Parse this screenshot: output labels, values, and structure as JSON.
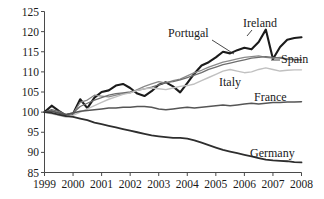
{
  "chart_data": {
    "type": "line",
    "title": "",
    "xlabel": "",
    "ylabel": "",
    "xlim": [
      1999,
      2008
    ],
    "ylim": [
      85,
      125
    ],
    "grid": false,
    "legend_position": "inline-annotations",
    "xticks": [
      "1999",
      "2000",
      "2001",
      "2002",
      "2003",
      "2004",
      "2005",
      "2006",
      "2007",
      "2008"
    ],
    "yticks": [
      "85",
      "90",
      "95",
      "100",
      "105",
      "110",
      "115",
      "120",
      "125"
    ],
    "x": [
      1999.0,
      1999.25,
      1999.5,
      1999.75,
      2000.0,
      2000.25,
      2000.5,
      2000.75,
      2001.0,
      2001.25,
      2001.5,
      2001.75,
      2002.0,
      2002.25,
      2002.5,
      2002.75,
      2003.0,
      2003.25,
      2003.5,
      2003.75,
      2004.0,
      2004.25,
      2004.5,
      2004.75,
      2005.0,
      2005.25,
      2005.5,
      2005.75,
      2006.0,
      2006.25,
      2006.5,
      2006.75,
      2007.0,
      2007.25,
      2007.5,
      2007.75,
      2008.0
    ],
    "series": [
      {
        "name": "Ireland",
        "color": "#1b1b1b",
        "width": 2.1,
        "label": "Ireland",
        "values": [
          100.0,
          101.6,
          100.3,
          99.2,
          99.6,
          103.2,
          101.0,
          103.6,
          105.0,
          105.4,
          106.6,
          107.0,
          106.0,
          104.6,
          104.0,
          105.2,
          106.8,
          107.4,
          106.4,
          104.9,
          107.2,
          109.6,
          111.6,
          112.4,
          113.6,
          115.0,
          114.6,
          115.4,
          116.0,
          115.6,
          117.4,
          120.5,
          113.2,
          116.2,
          118.0,
          118.4,
          118.6
        ]
      },
      {
        "name": "Portugal",
        "color": "#8a8a8a",
        "width": 1.3,
        "label": "Portugal",
        "values": [
          100.0,
          100.4,
          99.8,
          99.0,
          99.6,
          102.4,
          103.0,
          104.2,
          104.0,
          103.8,
          104.2,
          104.6,
          104.8,
          105.6,
          106.4,
          107.0,
          107.6,
          107.2,
          107.8,
          108.2,
          109.0,
          109.8,
          110.4,
          111.2,
          111.8,
          112.4,
          112.8,
          113.2,
          113.6,
          113.8,
          114.0,
          113.6,
          113.4,
          113.6,
          113.2,
          113.0,
          113.0
        ]
      },
      {
        "name": "Spain",
        "color": "#6e6e6e",
        "width": 1.3,
        "label": "Spain",
        "values": [
          100.0,
          100.6,
          100.2,
          99.4,
          99.8,
          101.4,
          102.2,
          103.0,
          103.6,
          104.2,
          104.6,
          104.8,
          105.0,
          105.4,
          105.8,
          106.2,
          106.8,
          107.4,
          107.6,
          108.0,
          108.6,
          109.2,
          109.8,
          110.6,
          111.2,
          111.8,
          112.2,
          112.6,
          113.0,
          113.4,
          113.6,
          113.8,
          113.6,
          113.4,
          113.2,
          113.1,
          113.0
        ]
      },
      {
        "name": "Italy",
        "color": "#c0c0c0",
        "width": 1.4,
        "label": "Italy",
        "values": [
          100.0,
          99.6,
          99.2,
          98.8,
          99.2,
          100.0,
          100.8,
          101.6,
          102.4,
          103.2,
          103.8,
          104.4,
          104.8,
          105.4,
          105.8,
          106.0,
          105.8,
          105.6,
          106.0,
          106.4,
          106.6,
          107.0,
          107.8,
          108.6,
          109.4,
          110.2,
          110.6,
          110.2,
          109.8,
          110.0,
          110.6,
          111.0,
          110.6,
          110.2,
          110.4,
          110.5,
          110.5
        ]
      },
      {
        "name": "France",
        "color": "#555555",
        "width": 1.5,
        "label": "France",
        "values": [
          100.0,
          100.2,
          99.8,
          99.4,
          99.8,
          100.2,
          100.4,
          100.6,
          100.8,
          101.0,
          101.0,
          101.2,
          101.2,
          101.4,
          101.4,
          101.2,
          100.8,
          100.6,
          100.8,
          101.0,
          101.2,
          101.0,
          101.2,
          101.4,
          101.6,
          101.8,
          101.6,
          101.8,
          102.0,
          102.2,
          102.0,
          102.2,
          102.4,
          102.4,
          102.5,
          102.5,
          102.6
        ]
      },
      {
        "name": "Germany",
        "color": "#2e2e2e",
        "width": 1.8,
        "label": "Germany",
        "values": [
          100.0,
          99.8,
          99.4,
          99.0,
          98.8,
          98.4,
          98.0,
          97.4,
          97.0,
          96.6,
          96.2,
          95.8,
          95.4,
          95.0,
          94.6,
          94.2,
          94.0,
          93.8,
          93.6,
          93.6,
          93.4,
          93.0,
          92.4,
          91.8,
          91.2,
          90.6,
          90.2,
          89.8,
          89.4,
          89.0,
          88.6,
          88.2,
          88.0,
          87.9,
          87.8,
          87.6,
          87.5
        ]
      }
    ],
    "annotations": [
      {
        "name": "portugal-label",
        "text": "Portugal",
        "x": 168,
        "y": 37,
        "anchor": "start",
        "leader": {
          "x1": 212,
          "y1": 40,
          "x2": 234,
          "y2": 54
        }
      },
      {
        "name": "ireland-label",
        "text": "Ireland",
        "x": 243,
        "y": 27,
        "anchor": "start",
        "leader": {
          "x1": 252,
          "y1": 30,
          "x2": 247,
          "y2": 36
        }
      },
      {
        "name": "spain-label",
        "text": "Spain",
        "x": 281,
        "y": 63,
        "anchor": "start",
        "leader": {
          "x1": 280,
          "y1": 60,
          "x2": 271,
          "y2": 60
        }
      },
      {
        "name": "italy-label",
        "text": "Italy",
        "x": 219,
        "y": 86,
        "anchor": "start",
        "leader": null
      },
      {
        "name": "france-label",
        "text": "France",
        "x": 254,
        "y": 101,
        "anchor": "start",
        "leader": null
      },
      {
        "name": "germany-label",
        "text": "Germany",
        "x": 250,
        "y": 157,
        "anchor": "start",
        "leader": null
      }
    ]
  },
  "axes": {
    "axis_color": "#4a4a4a",
    "tick_color": "#4a4a4a",
    "text_color": "#1a1a1a"
  }
}
